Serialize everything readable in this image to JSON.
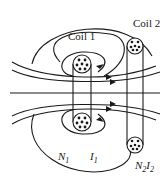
{
  "diagram": {
    "type": "magnetic field lines of two coaxial coils (mutual inductance)",
    "labels": {
      "coil1": "Coil 1",
      "coil2": "Coil 2",
      "n1_base": "N",
      "n1_sub": "1",
      "i1_base": "I",
      "i1_sub": "1",
      "n2_base": "N",
      "n2_sub": "2",
      "i2_base": "I",
      "i2_sub": "2"
    },
    "colors": {
      "line": "#1a1a1a",
      "background": "#ffffff"
    }
  }
}
